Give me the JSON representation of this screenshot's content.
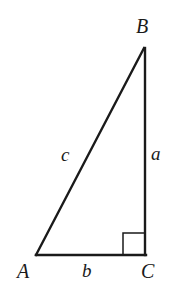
{
  "figure": {
    "type": "right-triangle-diagram",
    "background_color": "#ffffff",
    "stroke_color": "#1a1a1a",
    "label_color": "#1a1a1a"
  },
  "vertices": [
    {
      "id": "A",
      "label": "A",
      "x": 36,
      "y": 255,
      "label_x": 17,
      "label_y": 261
    },
    {
      "id": "B",
      "label": "B",
      "x": 144,
      "y": 48,
      "label_x": 136,
      "label_y": 16
    },
    {
      "id": "C",
      "label": "C",
      "x": 145,
      "y": 255,
      "label_x": 141,
      "label_y": 261
    }
  ],
  "sides": [
    {
      "id": "a",
      "label": "a",
      "between": "B-C",
      "label_x": 151,
      "label_y": 144
    },
    {
      "id": "b",
      "label": "b",
      "between": "A-C",
      "label_x": 82,
      "label_y": 261
    },
    {
      "id": "c",
      "label": "c",
      "between": "A-B",
      "label_x": 61,
      "label_y": 145
    }
  ],
  "right_angle": {
    "at_vertex": "C",
    "marker": "square",
    "size": 22,
    "x": 123,
    "y": 233
  },
  "geometry": {
    "hypotenuse_path": "M 36 255 L 144 48",
    "vertical_path": "M 145 48 L 145 255",
    "base_path": "M 36 255 L 146 255",
    "right_angle_path": "M 123 255 L 123 233 L 145 233",
    "stroke_width_triangle": 2.4,
    "stroke_width_marker": 1.5
  }
}
